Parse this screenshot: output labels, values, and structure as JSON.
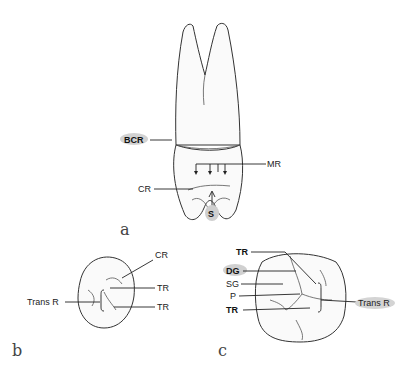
{
  "figure": {
    "panels": [
      {
        "id": "a",
        "label": "a",
        "view": "lateral tooth view",
        "annotations": [
          "BCR",
          "MR",
          "CR",
          "S"
        ]
      },
      {
        "id": "b",
        "label": "b",
        "view": "occlusal view (small)",
        "annotations": [
          "CR",
          "TR",
          "Trans R",
          "TR"
        ]
      },
      {
        "id": "c",
        "label": "c",
        "view": "occlusal view (large)",
        "annotations": [
          "TR",
          "DG",
          "SG",
          "P",
          "TR",
          "Trans R"
        ]
      }
    ],
    "labels": {
      "a_bcr": "BCR",
      "a_mr": "MR",
      "a_cr": "CR",
      "a_s": "S",
      "a_panel": "a",
      "b_cr": "CR",
      "b_tr1": "TR",
      "b_transr": "Trans R",
      "b_tr2": "TR",
      "b_panel": "b",
      "c_tr1": "TR",
      "c_dg": "DG",
      "c_sg": "SG",
      "c_p": "P",
      "c_tr2": "TR",
      "c_transr": "Trans R",
      "c_panel": "c"
    },
    "colors": {
      "line": "#222222",
      "highlight": "#c8c8c8",
      "background": "#ffffff"
    }
  }
}
